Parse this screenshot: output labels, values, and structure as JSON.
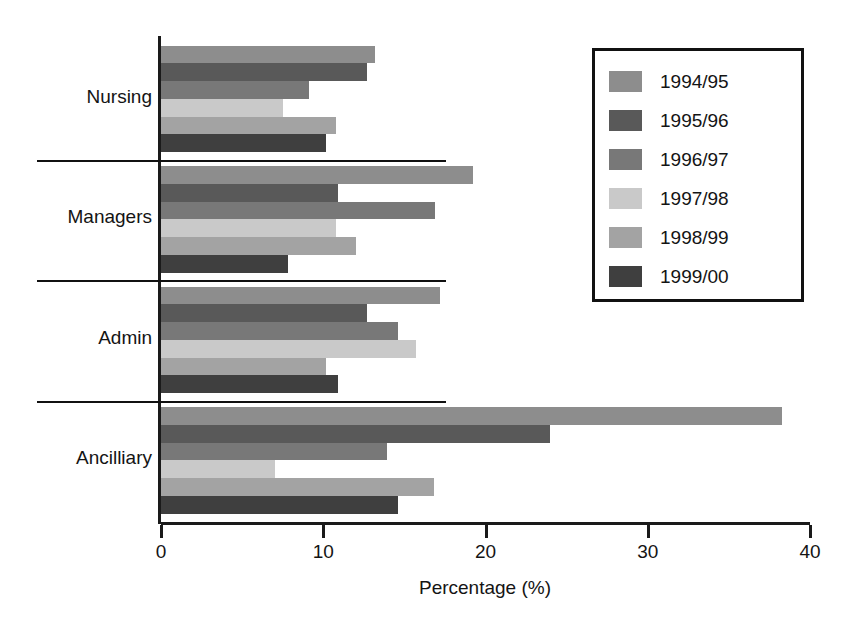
{
  "chart_data": {
    "type": "bar",
    "orientation": "horizontal",
    "title": "",
    "xlabel": "Percentage (%)",
    "ylabel": "",
    "xlim": [
      0,
      40
    ],
    "xticks": [
      0,
      10,
      20,
      30,
      40
    ],
    "grid": false,
    "legend_position": "top-right",
    "categories": [
      "Nursing",
      "Managers",
      "Admin",
      "Ancilliary"
    ],
    "series": [
      {
        "name": "1994/95",
        "color": "#8d8d8d",
        "values": [
          13.2,
          19.2,
          17.2,
          38.3
        ]
      },
      {
        "name": "1995/96",
        "color": "#595959",
        "values": [
          12.7,
          10.9,
          12.7,
          24.0
        ]
      },
      {
        "name": "1996/97",
        "color": "#787878",
        "values": [
          9.1,
          16.9,
          14.6,
          13.9
        ]
      },
      {
        "name": "1997/98",
        "color": "#c9c9c9",
        "values": [
          7.5,
          10.8,
          15.7,
          7.0
        ]
      },
      {
        "name": "1998/99",
        "color": "#a3a3a3",
        "values": [
          10.8,
          12.0,
          10.2,
          16.8
        ]
      },
      {
        "name": "1999/00",
        "color": "#3f3f3f",
        "values": [
          10.2,
          7.8,
          10.9,
          14.6
        ]
      }
    ]
  },
  "axis": {
    "x_title": "Percentage (%)",
    "tick_labels": [
      "0",
      "10",
      "20",
      "30",
      "40"
    ]
  },
  "legend": {
    "items": [
      {
        "label": "1994/95",
        "color": "#8d8d8d"
      },
      {
        "label": "1995/96",
        "color": "#595959"
      },
      {
        "label": "1996/97",
        "color": "#787878"
      },
      {
        "label": "1997/98",
        "color": "#c9c9c9"
      },
      {
        "label": "1998/99",
        "color": "#a3a3a3"
      },
      {
        "label": "1999/00",
        "color": "#3f3f3f"
      }
    ]
  }
}
